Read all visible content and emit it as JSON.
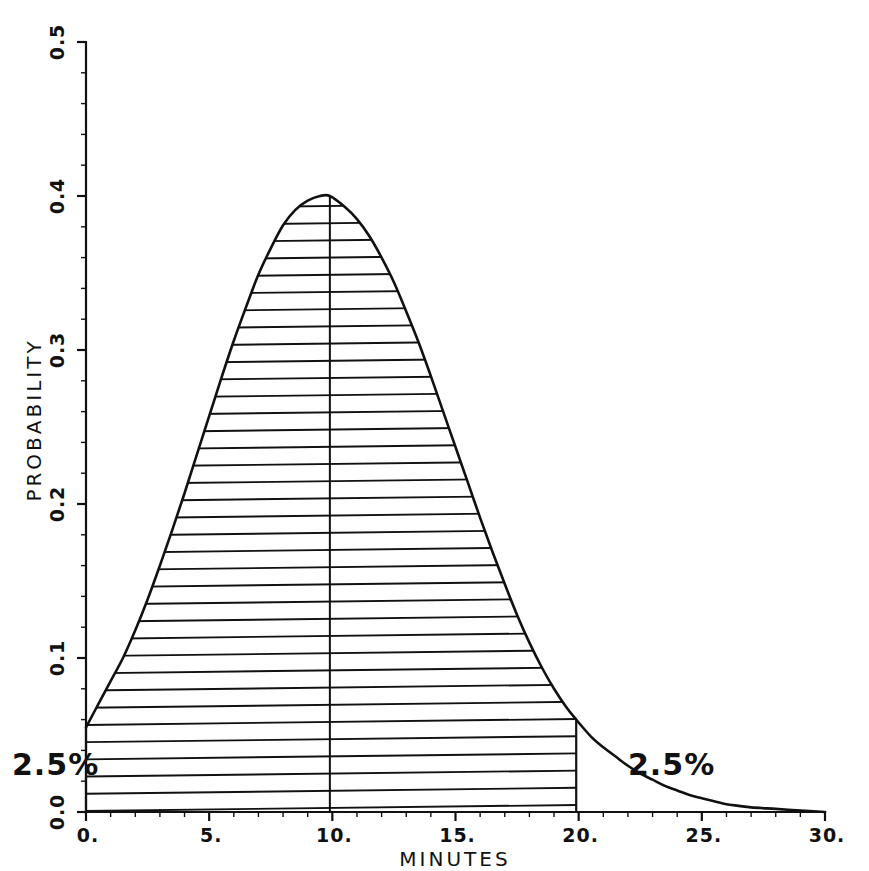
{
  "chart_data": {
    "type": "area",
    "title": "",
    "xlabel": "MINUTES",
    "ylabel": "PROBABILITY",
    "xlim": [
      0,
      30
    ],
    "ylim": [
      0.0,
      0.5
    ],
    "grid": false,
    "legend": null,
    "xticks": [
      0,
      5,
      10,
      15,
      20,
      25,
      30
    ],
    "xticklabels": [
      "0.",
      "5.",
      "10.",
      "15.",
      "20.",
      "25.",
      "30."
    ],
    "yticks": [
      0.0,
      0.1,
      0.2,
      0.3,
      0.4,
      0.5
    ],
    "yticklabels": [
      "0.0",
      "0.1",
      "0.2",
      "0.3",
      "0.4",
      "0.5"
    ],
    "x_minor_interval": 1,
    "y_minor_interval": 0.02,
    "series": [
      {
        "name": "probability density",
        "x": [
          0.0,
          0.5,
          1.0,
          1.5,
          2.0,
          2.5,
          3.0,
          3.5,
          4.0,
          4.5,
          5.0,
          5.5,
          6.0,
          6.5,
          7.0,
          7.5,
          8.0,
          8.5,
          9.0,
          9.5,
          9.9,
          10.5,
          11.0,
          11.5,
          12.0,
          12.5,
          13.0,
          13.5,
          14.0,
          14.5,
          15.0,
          15.5,
          16.0,
          16.5,
          17.0,
          17.5,
          18.0,
          18.5,
          19.0,
          19.5,
          19.9,
          20.5,
          21.0,
          21.5,
          22.0,
          22.5,
          23.0,
          23.5,
          24.0,
          24.5,
          25.0,
          25.5,
          26.0,
          26.5,
          27.0,
          28.0,
          29.0,
          30.0
        ],
        "y": [
          0.055,
          0.07,
          0.085,
          0.1,
          0.118,
          0.138,
          0.16,
          0.183,
          0.207,
          0.232,
          0.257,
          0.282,
          0.306,
          0.328,
          0.349,
          0.366,
          0.381,
          0.391,
          0.397,
          0.4,
          0.4,
          0.393,
          0.385,
          0.374,
          0.36,
          0.344,
          0.325,
          0.305,
          0.283,
          0.26,
          0.237,
          0.214,
          0.191,
          0.169,
          0.148,
          0.128,
          0.11,
          0.094,
          0.08,
          0.068,
          0.06,
          0.049,
          0.042,
          0.036,
          0.03,
          0.025,
          0.021,
          0.017,
          0.014,
          0.011,
          0.009,
          0.007,
          0.005,
          0.004,
          0.003,
          0.002,
          0.001,
          0.0
        ]
      }
    ],
    "shaded_region": {
      "x_start": 0.0,
      "x_end": 19.9,
      "style": "horizontal-hatch",
      "meaning": "central 95%"
    },
    "median_line": {
      "x": 9.9,
      "y_top": 0.4
    },
    "peak": {
      "x": 9.9,
      "y": 0.4
    },
    "annotations": [
      {
        "id": "left-tail",
        "text": "2.5%",
        "x_px": 12,
        "y_px": 775
      },
      {
        "id": "right-tail",
        "text": "2.5%",
        "x_px": 628,
        "y_px": 775
      }
    ]
  },
  "labels": {
    "x_axis_title": "MINUTES",
    "y_axis_title": "PROBABILITY",
    "left_tail_pct": "2.5%",
    "right_tail_pct": "2.5%"
  }
}
